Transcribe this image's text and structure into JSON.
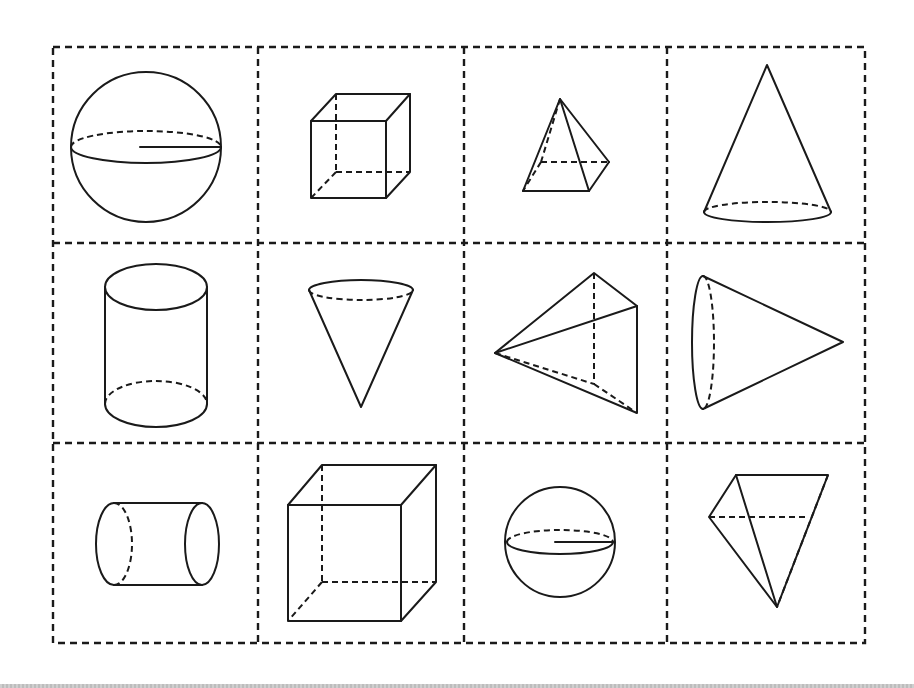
{
  "diagram": {
    "type": "geometric-solids-card-sheet",
    "grid": {
      "rows": 3,
      "cols": 4,
      "line_style": "dashed",
      "line_color": "#1a1a1a"
    },
    "cells": [
      {
        "row": 0,
        "col": 0,
        "shape": "sphere",
        "features": [
          "equator-ellipse",
          "hidden-back-arc",
          "radius-line"
        ]
      },
      {
        "row": 0,
        "col": 1,
        "shape": "cube",
        "size": "small",
        "features": [
          "hidden-edges"
        ]
      },
      {
        "row": 0,
        "col": 2,
        "shape": "square-pyramid",
        "features": [
          "hidden-edges"
        ]
      },
      {
        "row": 0,
        "col": 3,
        "shape": "cone",
        "orientation": "upright",
        "features": [
          "hidden-base-arc"
        ]
      },
      {
        "row": 1,
        "col": 0,
        "shape": "cylinder",
        "orientation": "upright",
        "features": [
          "hidden-base-arc"
        ]
      },
      {
        "row": 1,
        "col": 1,
        "shape": "cone",
        "orientation": "inverted",
        "features": [
          "hidden-top-arc"
        ]
      },
      {
        "row": 1,
        "col": 2,
        "shape": "triangular-pyramid",
        "features": [
          "hidden-edges"
        ]
      },
      {
        "row": 1,
        "col": 3,
        "shape": "cone",
        "orientation": "lying-right",
        "features": [
          "hidden-base-arc"
        ]
      },
      {
        "row": 2,
        "col": 0,
        "shape": "cylinder",
        "orientation": "lying",
        "features": [
          "hidden-base-arc"
        ]
      },
      {
        "row": 2,
        "col": 1,
        "shape": "cube",
        "size": "large",
        "features": [
          "hidden-edges"
        ]
      },
      {
        "row": 2,
        "col": 2,
        "shape": "sphere",
        "size": "small",
        "features": [
          "equator-ellipse",
          "hidden-back-arc",
          "radius-line"
        ]
      },
      {
        "row": 2,
        "col": 3,
        "shape": "triangular-pyramid",
        "orientation": "inverted",
        "features": [
          "hidden-edges"
        ]
      }
    ]
  }
}
